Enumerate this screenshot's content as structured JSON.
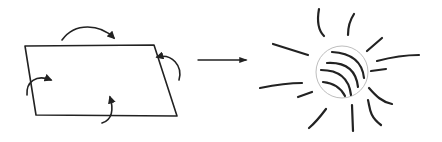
{
  "diagram": {
    "colors": {
      "stroke": "#222222",
      "circle_outline": "#b5b5b5",
      "background": "#ffffff"
    },
    "left_figure": {
      "shape": "parallelogram",
      "vertices": [
        [
          25,
          46
        ],
        [
          154,
          45
        ],
        [
          177,
          116
        ],
        [
          36,
          115
        ]
      ],
      "curved_arrows": 4
    },
    "transition_arrow": {
      "from": [
        198,
        60
      ],
      "to": [
        248,
        60
      ]
    },
    "right_figure": {
      "shape": "circle-with-rays",
      "center": [
        342,
        72
      ],
      "radius": 26,
      "inner_arcs": 4,
      "rays": 12
    }
  }
}
